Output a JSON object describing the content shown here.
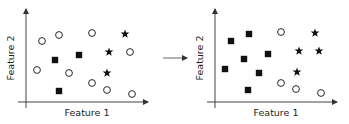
{
  "figure": {
    "arrow": {
      "x1": 163,
      "x2": 187,
      "y": 58,
      "color": "#666666"
    },
    "colors": {
      "ink": "#111111",
      "axis": "#444444"
    }
  },
  "left_plot": {
    "xlabel": "Feature 1",
    "ylabel": "Feature 2",
    "axes": {
      "origin_x": 26,
      "origin_y": 102,
      "x_start": 18,
      "x_end": 148,
      "y_top": 9,
      "y_bottom": 108
    },
    "xlabel_pos": {
      "x": 87,
      "y": 116
    },
    "ylabel_pos": {
      "x": 14,
      "y": 58
    },
    "points": {
      "circles": [
        [
          42,
          41
        ],
        [
          59,
          35
        ],
        [
          92,
          33
        ],
        [
          37,
          70
        ],
        [
          69,
          73
        ],
        [
          92,
          83
        ],
        [
          107,
          90
        ],
        [
          132,
          94
        ],
        [
          130,
          52
        ]
      ],
      "squares": [
        [
          55,
          60
        ],
        [
          79,
          55
        ],
        [
          59,
          91
        ]
      ],
      "stars": [
        [
          125,
          34
        ],
        [
          109,
          52
        ],
        [
          107,
          73
        ]
      ]
    }
  },
  "right_plot": {
    "xlabel": "Feature 1",
    "ylabel": "Feature 2",
    "axes": {
      "origin_x": 215,
      "origin_y": 102,
      "x_start": 207,
      "x_end": 337,
      "y_top": 9,
      "y_bottom": 108
    },
    "xlabel_pos": {
      "x": 276,
      "y": 116
    },
    "ylabel_pos": {
      "x": 203,
      "y": 58
    },
    "points": {
      "circles": [
        [
          281,
          32
        ],
        [
          281,
          83
        ],
        [
          296,
          89
        ],
        [
          321,
          93
        ]
      ],
      "squares": [
        [
          249,
          34
        ],
        [
          231,
          41
        ],
        [
          268,
          54
        ],
        [
          244,
          59
        ],
        [
          225,
          69
        ],
        [
          259,
          73
        ],
        [
          248,
          90
        ]
      ],
      "stars": [
        [
          315,
          33
        ],
        [
          299,
          51
        ],
        [
          319,
          51
        ],
        [
          297,
          72
        ]
      ]
    }
  }
}
